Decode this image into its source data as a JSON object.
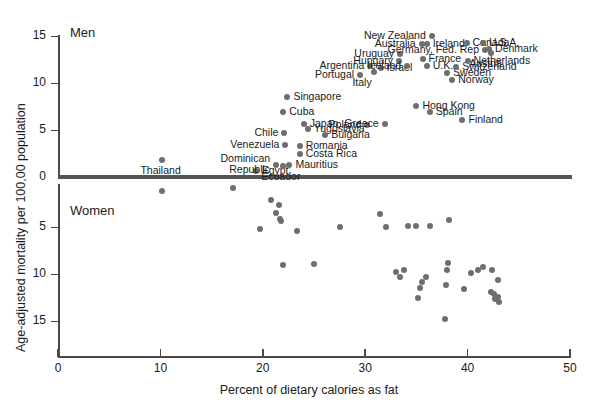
{
  "chart_data": {
    "type": "scatter",
    "title": "",
    "xlabel": "Percent of dietary calories as fat",
    "ylabel": "Age-adjusted mortality per 100,00 population",
    "xlim": [
      0,
      50
    ],
    "xticks": [
      0,
      10,
      20,
      30,
      40,
      50
    ],
    "grid": false,
    "legend": "none",
    "panels": [
      {
        "name": "Men",
        "label": "Men",
        "ylim": [
          0,
          15
        ],
        "yticks": [
          0,
          5,
          10,
          15
        ],
        "y_direction": "up",
        "labeled_points": [
          {
            "label": "Thailand",
            "x": 10.2,
            "y": 1.8,
            "anchor": "below"
          },
          {
            "label": "Egypt'",
            "x": 19.3,
            "y": 0.6,
            "anchor": "right"
          },
          {
            "label": "Dominican\nRepublic",
            "x": 21.3,
            "y": 1.3,
            "anchor": "left"
          },
          {
            "label": "Ecuador",
            "x": 22.0,
            "y": 1.2,
            "anchor": "below"
          },
          {
            "label": "Mauritius",
            "x": 22.6,
            "y": 1.3,
            "anchor": "right"
          },
          {
            "label": "Costa Rica",
            "x": 23.6,
            "y": 2.4,
            "anchor": "right"
          },
          {
            "label": "Venezuela",
            "x": 22.2,
            "y": 3.4,
            "anchor": "left"
          },
          {
            "label": "Romania",
            "x": 23.6,
            "y": 3.3,
            "anchor": "right"
          },
          {
            "label": "Chile",
            "x": 22.1,
            "y": 4.7,
            "anchor": "left"
          },
          {
            "label": "Yugoslavia",
            "x": 24.4,
            "y": 5.1,
            "anchor": "right"
          },
          {
            "label": "Bulgaria",
            "x": 26.1,
            "y": 4.5,
            "anchor": "right"
          },
          {
            "label": "Japan",
            "x": 24.0,
            "y": 5.6,
            "anchor": "above"
          },
          {
            "label": "Cuba",
            "x": 22.0,
            "y": 6.9,
            "anchor": "right"
          },
          {
            "label": "Poland",
            "x": 30.2,
            "y": 5.5,
            "anchor": "left"
          },
          {
            "label": "Greece",
            "x": 31.9,
            "y": 5.6,
            "anchor": "left"
          },
          {
            "label": "Singapore",
            "x": 22.4,
            "y": 8.5,
            "anchor": "above"
          },
          {
            "label": "Hong Kong",
            "x": 35.0,
            "y": 7.6,
            "anchor": "right"
          },
          {
            "label": "Spain",
            "x": 36.3,
            "y": 6.9,
            "anchor": "right"
          },
          {
            "label": "Finland",
            "x": 39.5,
            "y": 6.1,
            "anchor": "right"
          },
          {
            "label": "Portugal",
            "x": 29.5,
            "y": 10.8,
            "anchor": "left"
          },
          {
            "label": "Italy",
            "x": 30.9,
            "y": 11.2,
            "anchor": "below"
          },
          {
            "label": "Argentina",
            "x": 30.5,
            "y": 11.8,
            "anchor": "left"
          },
          {
            "label": "Israel",
            "x": 31.5,
            "y": 11.6,
            "anchor": "right"
          },
          {
            "label": "Hungary",
            "x": 33.3,
            "y": 12.3,
            "anchor": "left"
          },
          {
            "label": "Iceland",
            "x": 34.1,
            "y": 11.8,
            "anchor": "left"
          },
          {
            "label": "U.K.",
            "x": 36.0,
            "y": 11.8,
            "anchor": "right"
          },
          {
            "label": "Uruguay",
            "x": 33.4,
            "y": 13.1,
            "anchor": "left"
          },
          {
            "label": "France",
            "x": 35.6,
            "y": 12.6,
            "anchor": "right"
          },
          {
            "label": "Sweden",
            "x": 38.0,
            "y": 11.1,
            "anchor": "right"
          },
          {
            "label": "Norway",
            "x": 38.5,
            "y": 10.3,
            "anchor": "right"
          },
          {
            "label": "Switzerland",
            "x": 38.9,
            "y": 11.7,
            "anchor": "right"
          },
          {
            "label": "Netherlands",
            "x": 40.0,
            "y": 12.3,
            "anchor": "right"
          },
          {
            "label": "Australia",
            "x": 35.5,
            "y": 14.2,
            "anchor": "left"
          },
          {
            "label": "Ireland",
            "x": 36.0,
            "y": 14.2,
            "anchor": "right"
          },
          {
            "label": "New Zealand",
            "x": 36.5,
            "y": 15.0,
            "anchor": "left"
          },
          {
            "label": "Germany, Fed. Rep",
            "x": 41.7,
            "y": 13.5,
            "anchor": "left"
          },
          {
            "label": "Canada",
            "x": 39.9,
            "y": 14.3,
            "anchor": "above"
          },
          {
            "label": "U.S.A.",
            "x": 41.5,
            "y": 14.3,
            "anchor": "right"
          },
          {
            "label": "Denmark",
            "x": 42.1,
            "y": 13.6,
            "anchor": "right"
          },
          {
            "label": "Austria",
            "x": 42.3,
            "y": 13.2,
            "anchor": "below"
          }
        ]
      },
      {
        "name": "Women",
        "label": "Women",
        "ylim": [
          0,
          18
        ],
        "yticks": [
          5,
          10,
          15
        ],
        "y_direction": "down",
        "points": [
          {
            "x": 10.2,
            "y": 1.2
          },
          {
            "x": 17.1,
            "y": 0.9
          },
          {
            "x": 19.7,
            "y": 5.2
          },
          {
            "x": 20.8,
            "y": 2.1
          },
          {
            "x": 21.6,
            "y": 2.7
          },
          {
            "x": 21.3,
            "y": 3.5
          },
          {
            "x": 21.8,
            "y": 4.4
          },
          {
            "x": 21.7,
            "y": 4.1
          },
          {
            "x": 22.0,
            "y": 9.0
          },
          {
            "x": 23.3,
            "y": 5.4
          },
          {
            "x": 25.0,
            "y": 8.9
          },
          {
            "x": 27.5,
            "y": 5.0
          },
          {
            "x": 31.4,
            "y": 3.6
          },
          {
            "x": 32.0,
            "y": 5.0
          },
          {
            "x": 33.0,
            "y": 9.8
          },
          {
            "x": 33.4,
            "y": 10.3
          },
          {
            "x": 33.8,
            "y": 9.6
          },
          {
            "x": 34.2,
            "y": 4.9
          },
          {
            "x": 35.0,
            "y": 4.9
          },
          {
            "x": 35.2,
            "y": 12.5
          },
          {
            "x": 35.4,
            "y": 11.5
          },
          {
            "x": 35.5,
            "y": 10.8
          },
          {
            "x": 35.9,
            "y": 10.3
          },
          {
            "x": 36.3,
            "y": 4.9
          },
          {
            "x": 37.8,
            "y": 14.8
          },
          {
            "x": 37.9,
            "y": 11.2
          },
          {
            "x": 38.0,
            "y": 9.6
          },
          {
            "x": 38.1,
            "y": 8.8
          },
          {
            "x": 38.2,
            "y": 4.3
          },
          {
            "x": 39.6,
            "y": 11.6
          },
          {
            "x": 40.3,
            "y": 9.9
          },
          {
            "x": 41.0,
            "y": 9.6
          },
          {
            "x": 41.5,
            "y": 9.3
          },
          {
            "x": 42.3,
            "y": 11.9
          },
          {
            "x": 42.6,
            "y": 12.1
          },
          {
            "x": 43.0,
            "y": 12.4
          },
          {
            "x": 42.4,
            "y": 9.6
          },
          {
            "x": 42.7,
            "y": 12.7
          },
          {
            "x": 43.0,
            "y": 10.6
          },
          {
            "x": 43.1,
            "y": 13.0
          }
        ]
      }
    ]
  }
}
